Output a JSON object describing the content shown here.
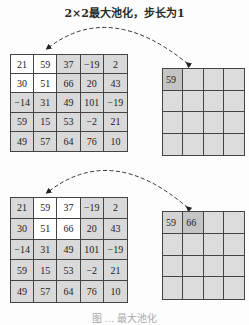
{
  "title": "2×2最大池化，步长为1",
  "caption": "图 ... 最大池化",
  "colors": {
    "cell_gray": "#d9d9d9",
    "window_white": "#ffffff",
    "output_gray": "#dcdcdc",
    "output_filled": "#c4c4c4",
    "line": "#444444"
  },
  "input_matrix": [
    [
      "21",
      "59",
      "37",
      "−19",
      "2"
    ],
    [
      "30",
      "51",
      "66",
      "20",
      "43"
    ],
    [
      "−14",
      "31",
      "49",
      "101",
      "−19"
    ],
    [
      "59",
      "15",
      "53",
      "−2",
      "21"
    ],
    [
      "49",
      "57",
      "64",
      "76",
      "10"
    ]
  ],
  "steps": [
    {
      "window": {
        "row": 0,
        "col": 0,
        "size": 2
      },
      "output": [
        [
          "59",
          "",
          "",
          ""
        ],
        [
          "",
          "",
          "",
          ""
        ],
        [
          "",
          "",
          "",
          ""
        ],
        [
          "",
          "",
          "",
          ""
        ]
      ],
      "current_output_cell": {
        "row": 0,
        "col": 0
      }
    },
    {
      "window": {
        "row": 0,
        "col": 1,
        "size": 2
      },
      "output": [
        [
          "59",
          "66",
          "",
          ""
        ],
        [
          "",
          "",
          "",
          ""
        ],
        [
          "",
          "",
          "",
          ""
        ],
        [
          "",
          "",
          "",
          ""
        ]
      ],
      "current_output_cell": {
        "row": 0,
        "col": 1
      }
    }
  ]
}
